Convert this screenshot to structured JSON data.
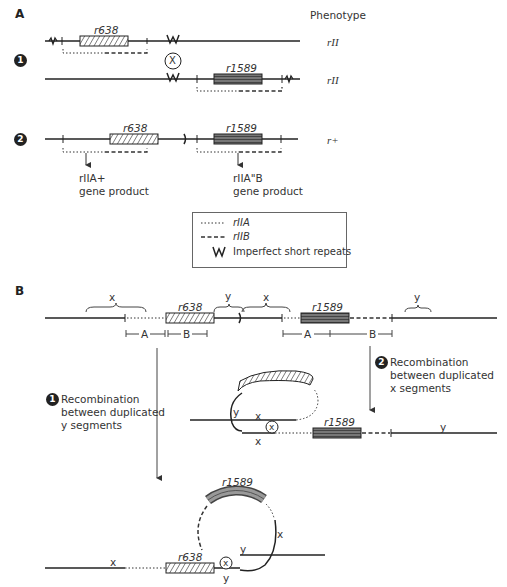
{
  "panel_a": {
    "label": "A",
    "phenotype_header": "Phenotype",
    "case1": {
      "number": "1",
      "line1": {
        "gene_label": "r638",
        "phenotype": "rII"
      },
      "line2": {
        "gene_label": "r1589",
        "phenotype": "rII"
      },
      "crossover_symbol": "X"
    },
    "case2": {
      "number": "2",
      "gene1_label": "r638",
      "gene2_label": "r1589",
      "phenotype": "r+",
      "product1": {
        "line1": "rIIA+",
        "line2": "gene product"
      },
      "product2": {
        "line1": "rIIA\"B",
        "line2": "gene product"
      }
    },
    "legend": [
      {
        "symbol": "dotted-line",
        "label": "rIIA"
      },
      {
        "symbol": "dashed-line",
        "label": "rIIB"
      },
      {
        "symbol": "W",
        "label": "Imperfect short repeats"
      }
    ]
  },
  "panel_b": {
    "label": "B",
    "top_row": {
      "brace_labels": [
        "x",
        "y",
        "x",
        "y"
      ],
      "gene1_label": "r638",
      "gene2_label": "r1589",
      "segment_labels": [
        "A",
        "B",
        "A",
        "B"
      ]
    },
    "pathway1": {
      "number": "1",
      "line1": "Recombination",
      "line2": "between duplicated",
      "line3": "y segments",
      "result": {
        "gene_loop": "r1589",
        "gene_linear": "r638",
        "labels": [
          "x",
          "x",
          "y",
          "y"
        ],
        "crossover_symbol": "x"
      }
    },
    "pathway2": {
      "number": "2",
      "line1": "Recombination",
      "line2": "between duplicated",
      "line3": "x segments",
      "result": {
        "gene_label": "r1589",
        "labels": [
          "y",
          "x",
          "x",
          "y"
        ],
        "crossover_symbol": "x"
      }
    }
  }
}
